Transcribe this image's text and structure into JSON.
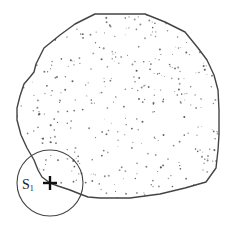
{
  "diagram": {
    "type": "stippled-region-with-sensor",
    "region": {
      "name": "target-area",
      "fill_pattern": "random-dots",
      "stroke_color": "#444444",
      "dot_color": "#555555",
      "dot_count": 420,
      "outline": [
        [
          95,
          14
        ],
        [
          145,
          14
        ],
        [
          165,
          22
        ],
        [
          185,
          32
        ],
        [
          198,
          48
        ],
        [
          207,
          60
        ],
        [
          214,
          75
        ],
        [
          218,
          90
        ],
        [
          219,
          110
        ],
        [
          219,
          135
        ],
        [
          218,
          150
        ],
        [
          216,
          168
        ],
        [
          206,
          182
        ],
        [
          185,
          188
        ],
        [
          160,
          194
        ],
        [
          130,
          198
        ],
        [
          100,
          198
        ],
        [
          88,
          197
        ],
        [
          80,
          194
        ],
        [
          70,
          190
        ],
        [
          58,
          186
        ],
        [
          50,
          183
        ],
        [
          42,
          177
        ],
        [
          38,
          170
        ],
        [
          34,
          160
        ],
        [
          27,
          148
        ],
        [
          21,
          135
        ],
        [
          17,
          120
        ],
        [
          17,
          108
        ],
        [
          20,
          96
        ],
        [
          24,
          84
        ],
        [
          30,
          77
        ],
        [
          34,
          72
        ],
        [
          36,
          64
        ],
        [
          44,
          48
        ],
        [
          60,
          35
        ],
        [
          75,
          24
        ]
      ]
    },
    "sensor": {
      "label": "S",
      "subscript": "1",
      "marker": "cross",
      "center": [
        50,
        183
      ],
      "coverage_radius": 33,
      "stroke_color": "#444444"
    }
  }
}
